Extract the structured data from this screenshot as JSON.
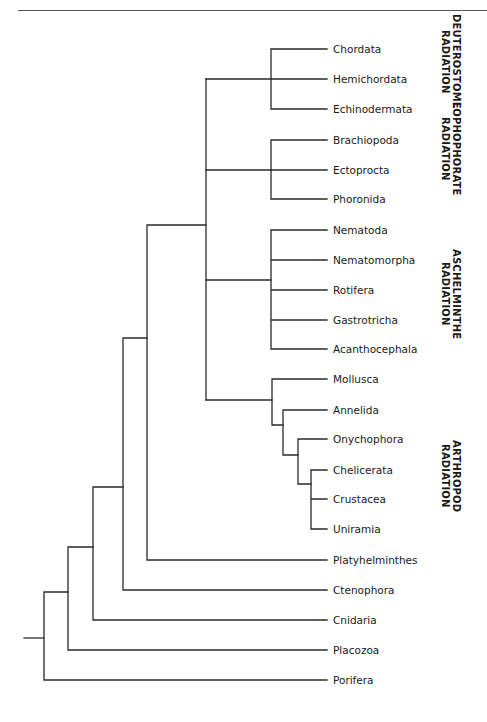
{
  "diagram": {
    "type": "cladogram",
    "leaves": [
      {
        "label": "Chordata",
        "y": 49
      },
      {
        "label": "Hemichordata",
        "y": 79
      },
      {
        "label": "Echinodermata",
        "y": 109
      },
      {
        "label": "Brachiopoda",
        "y": 140
      },
      {
        "label": "Ectoprocta",
        "y": 170
      },
      {
        "label": "Phoronida",
        "y": 199
      },
      {
        "label": "Nematoda",
        "y": 230
      },
      {
        "label": "Nematomorpha",
        "y": 260
      },
      {
        "label": "Rotifera",
        "y": 290
      },
      {
        "label": "Gastrotricha",
        "y": 320
      },
      {
        "label": "Acanthocephala",
        "y": 349
      },
      {
        "label": "Mollusca",
        "y": 379
      },
      {
        "label": "Annelida",
        "y": 410
      },
      {
        "label": "Onychophora",
        "y": 439
      },
      {
        "label": "Chelicerata",
        "y": 470
      },
      {
        "label": "Crustacea",
        "y": 499
      },
      {
        "label": "Uniramia",
        "y": 529
      },
      {
        "label": "Platyhelminthes",
        "y": 560
      },
      {
        "label": "Ctenophora",
        "y": 590
      },
      {
        "label": "Cnidaria",
        "y": 620
      },
      {
        "label": "Placozoa",
        "y": 650
      },
      {
        "label": "Porifera",
        "y": 680
      }
    ],
    "groups": [
      {
        "line1": "DEUTEROSTOME",
        "line2": "RADIATION",
        "top": 14
      },
      {
        "line1": "LOPHOPHORATE",
        "line2": "RADIATION",
        "top": 102
      },
      {
        "line1": "ASCHELMINTHE",
        "line2": "RADIATION",
        "top": 249
      },
      {
        "line1": "ARTHROPOD",
        "line2": "RADIATION",
        "top": 440
      }
    ]
  }
}
